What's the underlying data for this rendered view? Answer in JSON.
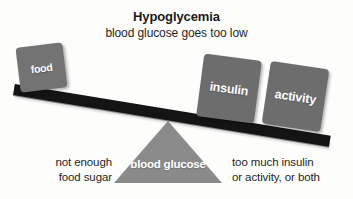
{
  "diagram": {
    "title": "Hypoglycemia",
    "subtitle": "blood glucose goes too low",
    "type": "balance-seesaw",
    "colors": {
      "block_gray": "#6d6d6d",
      "fulcrum_gray": "#8a8a8a",
      "beam_black": "#141414",
      "text_dark": "#1f1f1f",
      "text_light": "#ffffff",
      "background": "#fdfdfc"
    },
    "fulcrum": {
      "label": "blood glucose"
    },
    "beam": {
      "tilt_direction": "down-to-the-right",
      "tilt_degrees": 9.3
    },
    "blocks": [
      {
        "id": "food",
        "label": "food",
        "side": "left",
        "state": "raised"
      },
      {
        "id": "insulin",
        "label": "insulin",
        "side": "right",
        "state": "lowered"
      },
      {
        "id": "activity",
        "label": "activity",
        "side": "right",
        "state": "lowered"
      }
    ],
    "captions": {
      "left": "not enough\nfood sugar",
      "right": "too much insulin\nor activity, or both"
    }
  }
}
